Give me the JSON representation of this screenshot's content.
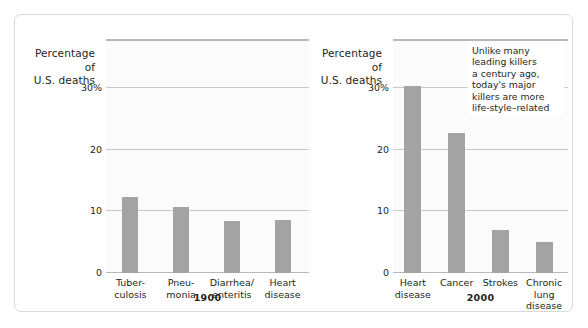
{
  "figure": {
    "border_color": "#d9d9d9",
    "bar_color": "#a3a3a3",
    "grid_color": "#c9c9c9",
    "panel_bg": "#fbfbfb"
  },
  "chart_data": [
    {
      "type": "bar",
      "title": "1900",
      "ylabel": "Percentage\nof\nU.S. deaths",
      "xlabel": "",
      "categories": [
        "Tuber-\nculosis",
        "Pneu-\nmonia",
        "Diarrhea/\nenteritis",
        "Heart\ndisease"
      ],
      "values": [
        12.4,
        10.8,
        8.5,
        8.6
      ],
      "ylim": [
        0,
        38
      ],
      "yticks": [
        0,
        10,
        20,
        30
      ],
      "ytick_labels": [
        "0",
        "10",
        "20",
        "30%"
      ],
      "grid": true,
      "legend": "none",
      "annotations": []
    },
    {
      "type": "bar",
      "title": "2000",
      "ylabel": "Percentage\nof\nU.S. deaths",
      "xlabel": "",
      "categories": [
        "Heart\ndisease",
        "Cancer",
        "Strokes",
        "Chronic\nlung disease"
      ],
      "values": [
        30.3,
        22.8,
        7.0,
        5.1
      ],
      "ylim": [
        0,
        38
      ],
      "yticks": [
        0,
        10,
        20,
        30
      ],
      "ytick_labels": [
        "0",
        "10",
        "20",
        "30%"
      ],
      "grid": true,
      "legend": "none",
      "annotations": [
        "Unlike many\nleading killers\na century ago,\ntoday's major\nkillers are more\nlife-style–related"
      ]
    }
  ],
  "left_chart": {
    "axis_title": "Percentage\nof\nU.S. deaths",
    "year": "1900",
    "ticks": [
      {
        "label": "30%",
        "value": 30
      },
      {
        "label": "20",
        "value": 20
      },
      {
        "label": "10",
        "value": 10
      },
      {
        "label": "0",
        "value": 0
      }
    ],
    "bars": [
      {
        "label": "Tuber-\nculosis",
        "value": 12.4
      },
      {
        "label": "Pneu-\nmonia",
        "value": 10.8
      },
      {
        "label": "Diarrhea/\nenteritis",
        "value": 8.5
      },
      {
        "label": "Heart\ndisease",
        "value": 8.6
      }
    ]
  },
  "right_chart": {
    "axis_title": "Percentage\nof\nU.S. deaths",
    "year": "2000",
    "ticks": [
      {
        "label": "30%",
        "value": 30
      },
      {
        "label": "20",
        "value": 20
      },
      {
        "label": "10",
        "value": 10
      },
      {
        "label": "0",
        "value": 0
      }
    ],
    "bars": [
      {
        "label": "Heart\ndisease",
        "value": 30.3
      },
      {
        "label": "Cancer",
        "value": 22.8
      },
      {
        "label": "Strokes",
        "value": 7.0
      },
      {
        "label": "Chronic\nlung disease",
        "value": 5.1
      }
    ],
    "annotation": "Unlike many\nleading killers\na century ago,\ntoday's major\nkillers are more\nlife-style–related"
  }
}
